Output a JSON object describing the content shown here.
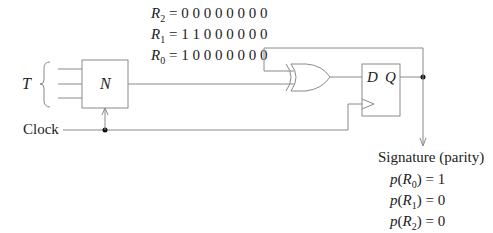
{
  "registers": [
    {
      "name": "R",
      "sub": "2",
      "bits": "0 0 0 0 0 0 0 0"
    },
    {
      "name": "R",
      "sub": "1",
      "bits": "1 1 0 0 0 0 0 0"
    },
    {
      "name": "R",
      "sub": "0",
      "bits": "1 0 0 0 0 0 0 0"
    }
  ],
  "input_label": "T",
  "block_label": "N",
  "clock_label": "Clock",
  "flipflop": {
    "d_label": "D",
    "q_label": "Q"
  },
  "signature": {
    "title": "Signature (parity)",
    "items": [
      {
        "fn": "p",
        "reg": "R",
        "sub": "0",
        "value": "1"
      },
      {
        "fn": "p",
        "reg": "R",
        "sub": "1",
        "value": "0"
      },
      {
        "fn": "p",
        "reg": "R",
        "sub": "2",
        "value": "0"
      }
    ]
  },
  "colors": {
    "wire": "#8a8a8a",
    "text": "#222222",
    "dot": "#111111"
  }
}
